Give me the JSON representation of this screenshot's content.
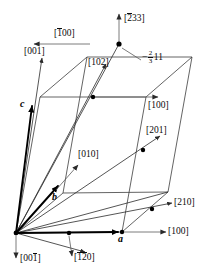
{
  "figure": {
    "kind": "crystallographic-unit-cell-direction-diagram",
    "background_color": "#ffffff",
    "line_color": "#3c3c3c",
    "bold_line_color": "#000000",
    "text_color": "#0a0a0a",
    "dot_color": "#000000"
  },
  "basis_vectors": [
    {
      "id": "a",
      "label": "a",
      "style": "bold-italic"
    },
    {
      "id": "b",
      "label": "b",
      "style": "bold-italic"
    },
    {
      "id": "c",
      "label": "c",
      "style": "bold-italic"
    }
  ],
  "direction_labels": [
    {
      "id": "d-1bar00",
      "text": "[100]",
      "bar_over": "1",
      "bar_start": 1,
      "bar_len": 1,
      "display": "[̈1̈00]",
      "arrow": "left"
    },
    {
      "id": "d-001",
      "text": "[001]",
      "bar_over": "",
      "arrow": "up"
    },
    {
      "id": "d-102",
      "text": "[102]",
      "bar_over": "",
      "arrow": "up-right"
    },
    {
      "id": "d-2bar33",
      "text": "[233]",
      "bar_over": "2",
      "bar_start": 1,
      "bar_len": 1,
      "arrow": "up"
    },
    {
      "id": "d-100-mid",
      "text": "[100]",
      "bar_over": "",
      "arrow": "right"
    },
    {
      "id": "d-010",
      "text": "[010]",
      "bar_over": "",
      "arrow": "up-right"
    },
    {
      "id": "d-201",
      "text": "[201]",
      "bar_over": "",
      "arrow": "up-right"
    },
    {
      "id": "d-210",
      "text": "[210]",
      "bar_over": "",
      "arrow": "right"
    },
    {
      "id": "d-100-bot",
      "text": "[100]",
      "bar_over": "",
      "arrow": "right"
    },
    {
      "id": "d-001bar",
      "text": "[001]",
      "bar_over": "1",
      "bar_start": 3,
      "bar_len": 1,
      "arrow": "down"
    },
    {
      "id": "d-1bar2bar0",
      "text": "[120]",
      "bar_over": "12",
      "bar_start": 1,
      "bar_len": 2,
      "arrow": "down"
    }
  ],
  "fraction_annotation": {
    "id": "frac-2-3-11",
    "sign": "−",
    "numerator": "2",
    "denominator": "3",
    "trailing": "11",
    "full_text": "−2/3 1 1"
  },
  "label_text": {
    "bracket_open": "[",
    "bracket_close": "]",
    "one": "1",
    "two": "2",
    "three": "3",
    "zero": "0",
    "d_1bar00_pre": "[",
    "d_1bar00_bar": "1",
    "d_1bar00_post": "00]",
    "d_001": "[001]",
    "d_102": "[102]",
    "d_2bar33_pre": "[",
    "d_2bar33_bar": "2",
    "d_2bar33_post": "33]",
    "d_100_mid": "[100]",
    "d_010": "[010]",
    "d_201": "[201]",
    "d_210": "[210]",
    "d_100_bot": "[100]",
    "d_001bar_pre": "[00",
    "d_001bar_bar": "1",
    "d_001bar_post": "]",
    "d_1bar2bar0_pre": "[",
    "d_1bar2bar0_bar": "12",
    "d_1bar2bar0_post": "0]",
    "axis_a": "a",
    "axis_b": "b",
    "axis_c": "c",
    "frac_sign": "−",
    "frac_num": "2",
    "frac_den": "3",
    "frac_tail": "11"
  },
  "geometry": {
    "origin": {
      "x": 16,
      "y": 233
    },
    "vertices": {
      "O": {
        "x": 16,
        "y": 233
      },
      "A": {
        "x": 122,
        "y": 232
      },
      "B": {
        "x": 63,
        "y": 193
      },
      "C": {
        "x": 40,
        "y": 97
      },
      "AB": {
        "x": 168,
        "y": 192
      },
      "AC": {
        "x": 146,
        "y": 97
      },
      "BC": {
        "x": 87,
        "y": 57
      },
      "ABC": {
        "x": 192,
        "y": 57
      }
    },
    "lattice_points": [
      {
        "on": "a-axis-mid",
        "x": 69,
        "y": 233
      },
      {
        "on": "top-face",
        "x": 119,
        "y": 44
      },
      {
        "on": "c-face-mid",
        "x": 93,
        "y": 97
      },
      {
        "on": "201-line",
        "x": 143,
        "y": 150
      },
      {
        "on": "210-line",
        "x": 152,
        "y": 209
      },
      {
        "on": "origin-node",
        "x": 16,
        "y": 233
      },
      {
        "on": "a-corner",
        "x": 122,
        "y": 232
      }
    ]
  }
}
